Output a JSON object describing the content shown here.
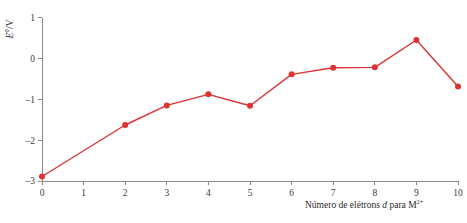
{
  "chart_data": {
    "type": "line",
    "title": "",
    "subtitle": "",
    "xlabel_parts": {
      "prefix": "Número de elétrons ",
      "italic": "d",
      "middle": " para M",
      "superscript": "2+"
    },
    "xlabel": "Número de elétrons d para M2+",
    "ylabel_parts": {
      "italic": "E",
      "rest": "°/V"
    },
    "ylabel": "E°/V",
    "x": [
      0,
      2,
      3,
      4,
      5,
      6,
      7,
      8,
      9,
      10
    ],
    "values": [
      -2.89,
      -1.63,
      -1.15,
      -0.88,
      -1.16,
      -0.39,
      -0.23,
      -0.22,
      0.45,
      -0.69
    ],
    "xlim": [
      0,
      10
    ],
    "ylim": [
      -3,
      1
    ],
    "xticks": [
      0,
      1,
      2,
      3,
      4,
      5,
      6,
      7,
      8,
      9,
      10
    ],
    "xtick_labels": [
      "0",
      "1",
      "2",
      "3",
      "4",
      "5",
      "6",
      "7",
      "8",
      "9",
      "10"
    ],
    "yticks": [
      1,
      0,
      -1,
      -2,
      -3
    ],
    "ytick_labels": [
      "1",
      "0",
      "–1",
      "–2",
      "–3"
    ],
    "grid": false,
    "legend": "none",
    "series_color": "#dd3333",
    "axis_color": "#8a8a8a",
    "text_color": "#3a3a3a",
    "marker": "circle",
    "marker_size": 3.0,
    "line_width": 1.4
  }
}
